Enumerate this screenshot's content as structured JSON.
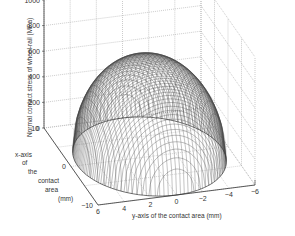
{
  "chart_data": {
    "type": "surface3d",
    "title": "",
    "zlabel": "Normal contact stress of wheel-rail (MPa)",
    "xlabel_lines": [
      "x-axis",
      "of",
      "the",
      "contact",
      "area",
      "(mm)"
    ],
    "ylabel": "y-axis of the contact area (mm)",
    "z_ticks": [
      "0",
      "200",
      "400",
      "600",
      "800",
      "1000"
    ],
    "x_ticks": [
      "10",
      "0",
      "−10"
    ],
    "y_ticks": [
      "6",
      "4",
      "2",
      "0",
      "−2",
      "−4",
      "−6"
    ],
    "zlim": [
      0,
      1000
    ],
    "xlim": [
      -10,
      10
    ],
    "ylim": [
      -6,
      6
    ],
    "grid": true,
    "surface": {
      "shape": "half-ellipsoid (Hertzian pressure distribution)",
      "peak_z": 750,
      "semi_axis_x": 10,
      "semi_axis_y": 5.5,
      "colormap": "grayscale"
    }
  }
}
